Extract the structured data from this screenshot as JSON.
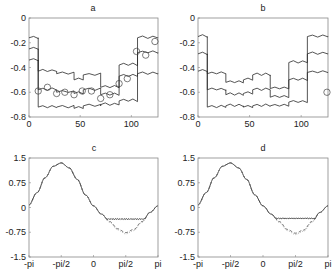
{
  "chart_data": [
    {
      "id": "a",
      "type": "line",
      "title": "a",
      "xlabel": "",
      "ylabel": "",
      "xlim": [
        0,
        126
      ],
      "ylim": [
        -0.8,
        0
      ],
      "xticks": [
        0,
        50,
        100
      ],
      "xtick_labels": [
        "0",
        "50",
        "100"
      ],
      "yticks": [
        0,
        -0.2,
        -0.4,
        -0.6,
        -0.8
      ],
      "ytick_labels": [
        "0",
        "-0.2",
        "-0.4",
        "-0.6",
        "-0.8"
      ],
      "grid": false,
      "series": [
        {
          "name": "upper",
          "style": "step",
          "steps": [
            [
              0,
              9,
              -0.16
            ],
            [
              9,
              27,
              -0.43
            ],
            [
              27,
              44,
              -0.45
            ],
            [
              44,
              53,
              -0.5
            ],
            [
              53,
              70,
              -0.46
            ],
            [
              70,
              88,
              -0.56
            ],
            [
              88,
              106,
              -0.38
            ],
            [
              106,
              126,
              -0.16
            ]
          ]
        },
        {
          "name": "middle",
          "style": "step",
          "steps": [
            [
              0,
              9,
              -0.25
            ],
            [
              9,
              27,
              -0.58
            ],
            [
              27,
              44,
              -0.6
            ],
            [
              44,
              53,
              -0.61
            ],
            [
              53,
              70,
              -0.58
            ],
            [
              70,
              88,
              -0.62
            ],
            [
              88,
              106,
              -0.47
            ],
            [
              106,
              126,
              -0.28
            ]
          ]
        },
        {
          "name": "lower",
          "style": "step",
          "steps": [
            [
              0,
              9,
              -0.34
            ],
            [
              9,
              27,
              -0.72
            ],
            [
              27,
              44,
              -0.72
            ],
            [
              44,
              53,
              -0.73
            ],
            [
              53,
              70,
              -0.71
            ],
            [
              70,
              88,
              -0.7
            ],
            [
              88,
              106,
              -0.67
            ],
            [
              106,
              126,
              -0.45
            ]
          ]
        }
      ],
      "markers": {
        "name": "circles",
        "shape": "circle",
        "x": [
          9,
          18,
          27,
          35,
          44,
          52,
          61,
          70,
          79,
          88,
          96,
          105,
          114,
          123
        ],
        "y": [
          -0.59,
          -0.56,
          -0.61,
          -0.6,
          -0.62,
          -0.59,
          -0.59,
          -0.65,
          -0.62,
          -0.53,
          -0.49,
          -0.27,
          -0.3,
          -0.19
        ]
      }
    },
    {
      "id": "b",
      "type": "line",
      "title": "b",
      "xlabel": "",
      "ylabel": "",
      "xlim": [
        0,
        126
      ],
      "ylim": [
        -0.8,
        0
      ],
      "xticks": [
        0,
        50,
        100
      ],
      "xtick_labels": [
        "0",
        "50",
        "100"
      ],
      "yticks": [
        0,
        -0.2,
        -0.4,
        -0.6,
        -0.8
      ],
      "ytick_labels": [
        "0",
        "-0.2",
        "-0.4",
        "-0.6",
        "-0.8"
      ],
      "grid": false,
      "series": [
        {
          "name": "upper",
          "style": "step",
          "steps": [
            [
              0,
              9,
              -0.15
            ],
            [
              9,
              27,
              -0.45
            ],
            [
              27,
              44,
              -0.52
            ],
            [
              44,
              53,
              -0.5
            ],
            [
              53,
              70,
              -0.46
            ],
            [
              70,
              88,
              -0.57
            ],
            [
              88,
              106,
              -0.36
            ],
            [
              106,
              126,
              -0.15
            ]
          ]
        },
        {
          "name": "middle",
          "style": "step",
          "steps": [
            [
              0,
              9,
              -0.29
            ],
            [
              9,
              27,
              -0.58
            ],
            [
              27,
              44,
              -0.62
            ],
            [
              44,
              53,
              -0.61
            ],
            [
              53,
              70,
              -0.58
            ],
            [
              70,
              88,
              -0.64
            ],
            [
              88,
              106,
              -0.5
            ],
            [
              106,
              126,
              -0.29
            ]
          ]
        },
        {
          "name": "lower",
          "style": "step",
          "steps": [
            [
              0,
              9,
              -0.43
            ],
            [
              9,
              27,
              -0.72
            ],
            [
              27,
              44,
              -0.71
            ],
            [
              44,
              53,
              -0.72
            ],
            [
              53,
              70,
              -0.71
            ],
            [
              70,
              88,
              -0.71
            ],
            [
              88,
              106,
              -0.68
            ],
            [
              106,
              126,
              -0.44
            ]
          ]
        }
      ],
      "markers": {
        "name": "circles",
        "shape": "circle",
        "x": [
          125
        ],
        "y": [
          -0.6
        ]
      }
    },
    {
      "id": "c",
      "type": "line",
      "title": "c",
      "xlabel": "",
      "ylabel": "",
      "xlim": [
        -3.1416,
        3.1416
      ],
      "ylim": [
        -1.5,
        1.5
      ],
      "xticks": [
        -3.1416,
        -1.5708,
        0,
        1.5708,
        3.1416
      ],
      "xtick_labels": [
        "-pi",
        "-pi/2",
        "0",
        "pi/2",
        "pi"
      ],
      "yticks": [
        1.5,
        0.75,
        0,
        -0.75,
        -1.5
      ],
      "ytick_labels": [
        "1.5",
        "0.75",
        "0",
        "-0.75",
        "-1.5"
      ],
      "grid": false,
      "series": [
        {
          "name": "solid",
          "style": "solid",
          "color": "#333333",
          "flat_floor": -0.35
        },
        {
          "name": "dashed",
          "style": "dashed",
          "color": "#444444",
          "flat_floor": null
        },
        {
          "name": "dotted",
          "style": "dotted",
          "color": "#999999",
          "flat_floor": null
        }
      ],
      "curve_samples": {
        "x": [
          -3.1416,
          -2.75,
          -2.36,
          -1.96,
          -1.5708,
          -1.18,
          -0.79,
          -0.39,
          0,
          0.39,
          0.79,
          1.18,
          1.5708,
          1.96,
          2.36,
          2.75,
          3.1416
        ],
        "y_true": [
          0.08,
          0.45,
          0.9,
          1.25,
          1.35,
          1.2,
          0.85,
          0.38,
          0.05,
          -0.2,
          -0.45,
          -0.68,
          -0.8,
          -0.7,
          -0.45,
          -0.15,
          0.05
        ]
      }
    },
    {
      "id": "d",
      "type": "line",
      "title": "d",
      "xlabel": "",
      "ylabel": "",
      "xlim": [
        -3.1416,
        3.1416
      ],
      "ylim": [
        -1.5,
        1.5
      ],
      "xticks": [
        -3.1416,
        -1.5708,
        0,
        1.5708,
        3.1416
      ],
      "xtick_labels": [
        "-pi",
        "-pi/2",
        "0",
        "pi/2",
        "pi"
      ],
      "yticks": [
        1.5,
        0.75,
        0,
        -0.75,
        -1.5
      ],
      "ytick_labels": [
        "1.5",
        "0.75",
        "0",
        "-0.75",
        "-1.5"
      ],
      "grid": false,
      "series": [
        {
          "name": "solid",
          "style": "solid",
          "color": "#333333",
          "flat_floor": -0.33
        },
        {
          "name": "dashed",
          "style": "dashed",
          "color": "#444444",
          "flat_floor": null
        },
        {
          "name": "dotted",
          "style": "dotted",
          "color": "#999999",
          "flat_floor": null
        }
      ],
      "curve_samples": {
        "x": [
          -3.1416,
          -2.75,
          -2.36,
          -1.96,
          -1.5708,
          -1.18,
          -0.79,
          -0.39,
          0,
          0.39,
          0.79,
          1.18,
          1.5708,
          1.96,
          2.36,
          2.75,
          3.1416
        ],
        "y_true": [
          0.08,
          0.45,
          0.9,
          1.25,
          1.35,
          1.2,
          0.85,
          0.38,
          0.05,
          -0.2,
          -0.45,
          -0.7,
          -0.82,
          -0.72,
          -0.45,
          -0.15,
          0.05
        ]
      }
    }
  ]
}
